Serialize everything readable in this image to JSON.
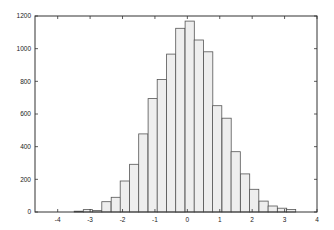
{
  "chart_data": {
    "type": "bar",
    "title": "",
    "xlabel": "",
    "ylabel": "",
    "xlim": [
      -4.7,
      4
    ],
    "ylim": [
      0,
      1200
    ],
    "grid": false,
    "legend": null,
    "bin_width": 0.285,
    "bin_left_edges": [
      -3.49,
      -3.21,
      -2.92,
      -2.64,
      -2.35,
      -2.07,
      -1.78,
      -1.5,
      -1.21,
      -0.93,
      -0.64,
      -0.36,
      -0.07,
      0.21,
      0.5,
      0.78,
      1.07,
      1.35,
      1.64,
      1.92,
      2.21,
      2.49,
      2.78,
      3.06
    ],
    "values": [
      5,
      15,
      10,
      63,
      90,
      190,
      292,
      478,
      694,
      812,
      967,
      1125,
      1169,
      1053,
      981,
      651,
      574,
      369,
      233,
      139,
      67,
      37,
      23,
      16
    ],
    "x_ticks": [
      "-4",
      "-3",
      "-2",
      "-1",
      "0",
      "1",
      "2",
      "3",
      "4"
    ],
    "x_tick_values": [
      -4,
      -3,
      -2,
      -1,
      0,
      1,
      2,
      3,
      4
    ],
    "y_ticks": [
      "0",
      "200",
      "400",
      "600",
      "800",
      "1000",
      "1200"
    ],
    "y_tick_values": [
      0,
      200,
      400,
      600,
      800,
      1000,
      1200
    ],
    "colors": {
      "bar_fill": "#eeeeee",
      "bar_edge": "#555555",
      "axis": "#333333"
    }
  }
}
